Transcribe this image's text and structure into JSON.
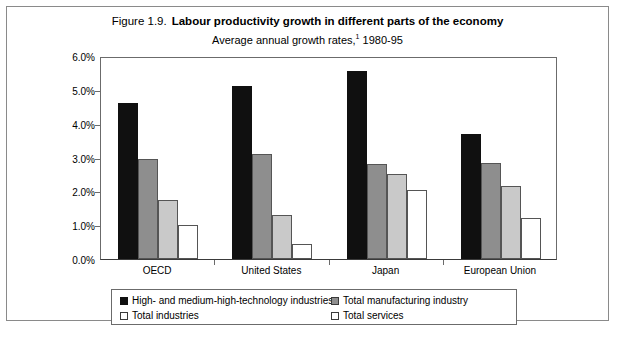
{
  "figure": {
    "label": "Figure 1.9.",
    "title": "Labour productivity growth in different parts of the economy",
    "subtitle_text": "Average annual growth rates,",
    "subtitle_footnote": "1",
    "subtitle_period": "1980-95"
  },
  "chart_data": {
    "type": "bar",
    "title": "Labour productivity growth in different parts of the economy",
    "subtitle": "Average annual growth rates,1 1980-95",
    "xlabel": "",
    "ylabel": "",
    "ylim": [
      0,
      6
    ],
    "ytick_labels": [
      "0.0%",
      "1.0%",
      "2.0%",
      "3.0%",
      "4.0%",
      "5.0%",
      "6.0%"
    ],
    "ytick_values": [
      0,
      1,
      2,
      3,
      4,
      5,
      6
    ],
    "grid": false,
    "legend_position": "bottom",
    "categories": [
      "OECD",
      "United States",
      "Japan",
      "European Union"
    ],
    "series": [
      {
        "name": "High- and medium-high-technology industries",
        "color": "#101010",
        "values": [
          4.6,
          5.1,
          5.55,
          3.7
        ]
      },
      {
        "name": "Total manufacturing industry",
        "color": "#8e8e8e",
        "values": [
          2.95,
          3.1,
          2.8,
          2.85
        ]
      },
      {
        "name": "Total industries",
        "color": "#c9c9c9",
        "values": [
          1.75,
          1.3,
          2.5,
          2.15
        ]
      },
      {
        "name": "Total services",
        "color": "#ffffff",
        "values": [
          1.0,
          0.45,
          2.05,
          1.2
        ]
      }
    ]
  }
}
